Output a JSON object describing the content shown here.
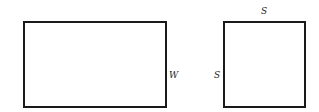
{
  "diagram": {
    "rectangle": {
      "side_label": "W",
      "x": 23,
      "y": 21,
      "width": 144,
      "height": 87
    },
    "square": {
      "top_label": "S",
      "left_label": "S",
      "x": 223,
      "y": 21,
      "width": 83,
      "height": 87
    },
    "stroke_color": "#1a1a1a",
    "background_color": "#ffffff"
  }
}
